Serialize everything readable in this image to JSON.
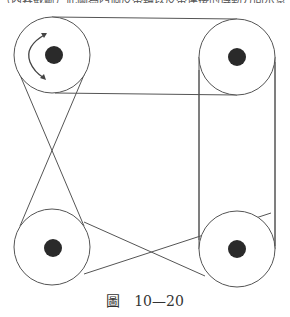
{
  "top_text_fragment": "（內容截斷）此圖為四個皮帶輪以皮帶連接的傳動方向示意",
  "caption": {
    "label": "圖",
    "number": "10—20"
  },
  "diagram": {
    "stroke_color": "#555555",
    "hub_color": "#2a2a2a",
    "pulleys": [
      {
        "id": "top-left",
        "cx": 52,
        "cy": 55,
        "r": 38,
        "hub_r": 9,
        "has_rotation_arrow": true
      },
      {
        "id": "top-right",
        "cx": 237,
        "cy": 57,
        "r": 38,
        "hub_r": 9,
        "has_rotation_arrow": false
      },
      {
        "id": "bottom-left",
        "cx": 52,
        "cy": 247,
        "r": 38,
        "hub_r": 9,
        "has_rotation_arrow": false
      },
      {
        "id": "bottom-right",
        "cx": 237,
        "cy": 249,
        "r": 38,
        "hub_r": 9,
        "has_rotation_arrow": false
      }
    ],
    "belts": [
      {
        "name": "top-open-belt",
        "type": "open"
      },
      {
        "name": "left-crossed-belt",
        "type": "crossed"
      },
      {
        "name": "right-open-belt",
        "type": "open"
      },
      {
        "name": "bottom-crossed-belt",
        "type": "crossed"
      }
    ]
  }
}
